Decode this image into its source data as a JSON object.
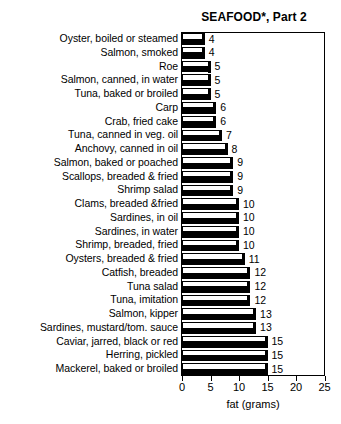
{
  "chart_data": {
    "type": "bar",
    "orientation": "horizontal",
    "title": "SEAFOOD*, Part 2",
    "xlabel": "fat (grams)",
    "ylabel": "",
    "xlim": [
      0,
      25
    ],
    "xticks": [
      0,
      5,
      10,
      15,
      20,
      25
    ],
    "xticklabels": [
      "0",
      "5",
      "10",
      "15",
      "20",
      "25"
    ],
    "grid": false,
    "legend": null,
    "value_labels": true,
    "categories": [
      "Oyster, boiled or steamed",
      "Salmon, smoked",
      "Roe",
      "Salmon, canned, in water",
      "Tuna, baked or broiled",
      "Carp",
      "Crab, fried cake",
      "Tuna, canned in veg. oil",
      "Anchovy, canned in oil",
      "Salmon, baked or poached",
      "Scallops, breaded & fried",
      "Shrimp salad",
      "Clams, breaded &fried",
      "Sardines, in oil",
      "Sardines, in water",
      "Shrimp, breaded, fried",
      "Oysters, breaded & fried",
      "Catfish, breaded",
      "Tuna salad",
      "Tuna, imitation",
      "Salmon, kipper",
      "Sardines, mustard/tom. sauce",
      "Caviar, jarred, black or red",
      "Herring, pickled",
      "Mackerel, baked or broiled"
    ],
    "values": [
      4,
      4,
      5,
      5,
      5,
      6,
      6,
      7,
      8,
      9,
      9,
      9,
      10,
      10,
      10,
      10,
      11,
      12,
      12,
      12,
      13,
      13,
      15,
      15,
      15
    ],
    "value_label_texts": [
      "4",
      "4",
      "5",
      "5",
      "5",
      "6",
      "6",
      "7",
      "8",
      "9",
      "9",
      "9",
      "10",
      "10",
      "10",
      "10",
      "11",
      "12",
      "12",
      "12",
      "13",
      "13",
      "15",
      "15",
      "15"
    ]
  },
  "colors": {
    "bar_fill": "#ffffff",
    "bar_outline": "#000000",
    "bar_shadow": "#000000",
    "text": "#000000",
    "background": "#ffffff"
  }
}
